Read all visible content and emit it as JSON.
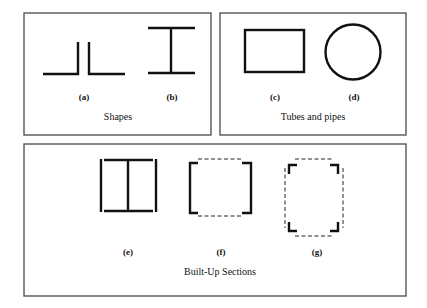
{
  "diagram": {
    "panels": [
      {
        "id": "shapes",
        "caption": "Shapes",
        "items": [
          {
            "label": "(a)",
            "shape": "double-angle"
          },
          {
            "label": "(b)",
            "shape": "i-beam"
          }
        ]
      },
      {
        "id": "tubes",
        "caption": "Tubes and pipes",
        "items": [
          {
            "label": "(c)",
            "shape": "rectangular-tube"
          },
          {
            "label": "(d)",
            "shape": "circular-pipe"
          }
        ]
      },
      {
        "id": "builtup",
        "caption": "Built-Up Sections",
        "items": [
          {
            "label": "(e)",
            "shape": "i-beam-with-side-plates"
          },
          {
            "label": "(f)",
            "shape": "two-channels-laced"
          },
          {
            "label": "(g)",
            "shape": "four-angles-laced"
          }
        ]
      }
    ],
    "colors": {
      "line": "#111111",
      "panel_border": "#555555",
      "background": "#ffffff"
    }
  }
}
